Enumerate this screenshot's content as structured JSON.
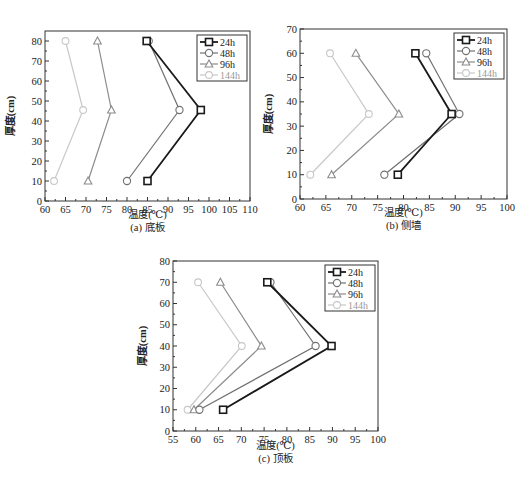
{
  "colors": {
    "24h": "#1a1a1a",
    "48h": "#707070",
    "96h": "#8c8c8c",
    "144h": "#c8c8c8",
    "axis": "#333333"
  },
  "legend": [
    "24h",
    "48h",
    "96h",
    "144h"
  ],
  "figure_caption": "",
  "chart_data": [
    {
      "type": "line",
      "title": "(a) 底板",
      "xlabel": "温度(℃)",
      "ylabel": "厚度(cm)",
      "xlim": [
        60,
        110
      ],
      "ylim": [
        0,
        85
      ],
      "xticks": [
        60,
        65,
        70,
        75,
        80,
        85,
        90,
        95,
        100,
        105,
        110
      ],
      "yticks": [
        0,
        10,
        20,
        30,
        40,
        50,
        60,
        70,
        80
      ],
      "grid": false,
      "legend_position": "upper right",
      "y": [
        10,
        45.5,
        80
      ],
      "series": [
        {
          "name": "24h",
          "marker": "square",
          "x": [
            85,
            98,
            84.8
          ]
        },
        {
          "name": "48h",
          "marker": "circle",
          "x": [
            80,
            92.8,
            85.3
          ]
        },
        {
          "name": "96h",
          "marker": "triangle",
          "x": [
            70.5,
            76.2,
            72.8
          ]
        },
        {
          "name": "144h",
          "marker": "diamond",
          "x": [
            62.2,
            69.3,
            65
          ]
        }
      ]
    },
    {
      "type": "line",
      "title": "(b) 侧墙",
      "xlabel": "温度(℃)",
      "ylabel": "厚度(cm)",
      "xlim": [
        60,
        100
      ],
      "ylim": [
        0,
        70
      ],
      "xticks": [
        60,
        65,
        70,
        75,
        80,
        85,
        90,
        95,
        100
      ],
      "yticks": [
        0,
        10,
        20,
        30,
        40,
        50,
        60,
        70
      ],
      "grid": false,
      "legend_position": "upper right",
      "y": [
        10,
        35,
        60
      ],
      "series": [
        {
          "name": "24h",
          "marker": "square",
          "x": [
            78.9,
            89.3,
            82.3
          ]
        },
        {
          "name": "48h",
          "marker": "circle",
          "x": [
            76.3,
            90.8,
            84.4
          ]
        },
        {
          "name": "96h",
          "marker": "triangle",
          "x": [
            66.1,
            79.1,
            70.8
          ]
        },
        {
          "name": "144h",
          "marker": "diamond",
          "x": [
            62,
            73.3,
            65.8
          ]
        }
      ]
    },
    {
      "type": "line",
      "title": "(c) 顶板",
      "xlabel": "温度(℃)",
      "ylabel": "厚度(cm)",
      "xlim": [
        55,
        100
      ],
      "ylim": [
        0,
        80
      ],
      "xticks": [
        55,
        60,
        65,
        70,
        75,
        80,
        85,
        90,
        95,
        100
      ],
      "yticks": [
        0,
        10,
        20,
        30,
        40,
        50,
        60,
        70,
        80
      ],
      "grid": false,
      "legend_position": "upper right",
      "y": [
        10,
        40,
        70
      ],
      "series": [
        {
          "name": "24h",
          "marker": "square",
          "x": [
            66,
            89.8,
            75.7
          ]
        },
        {
          "name": "48h",
          "marker": "circle",
          "x": [
            60.8,
            86.3,
            76.4
          ]
        },
        {
          "name": "96h",
          "marker": "triangle",
          "x": [
            59.6,
            74.4,
            65.4
          ]
        },
        {
          "name": "144h",
          "marker": "diamond",
          "x": [
            58.2,
            70.1,
            60.5
          ]
        }
      ]
    }
  ]
}
